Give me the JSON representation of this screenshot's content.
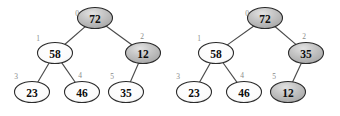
{
  "figure": {
    "background_color": "#ffffff",
    "node_white_fill": "#fbfbfb",
    "node_gray_fill": "#b9b9b9",
    "node_stroke": "#2b2b2b",
    "edge_color": "#4a4a4a",
    "index_label_color": "#8a8a8a",
    "value_label_color": "#0d0d0d"
  },
  "chart_data": {
    "type": "diagram",
    "title": "",
    "subtitle": "",
    "trees": [
      {
        "name": "tree-left",
        "nodes": [
          {
            "index": "0",
            "value": "72",
            "highlight": true,
            "cx": 95,
            "cy": 18,
            "idx_x": 77,
            "idx_y": 13
          },
          {
            "index": "1",
            "value": "58",
            "highlight": false,
            "cx": 55,
            "cy": 53,
            "idx_x": 38,
            "idx_y": 38
          },
          {
            "index": "2",
            "value": "12",
            "highlight": true,
            "cx": 143,
            "cy": 53,
            "idx_x": 142,
            "idx_y": 36
          },
          {
            "index": "3",
            "value": "23",
            "highlight": false,
            "cx": 32,
            "cy": 92,
            "idx_x": 16,
            "idx_y": 76
          },
          {
            "index": "4",
            "value": "46",
            "highlight": false,
            "cx": 82,
            "cy": 92,
            "idx_x": 80,
            "idx_y": 75
          },
          {
            "index": "5",
            "value": "35",
            "highlight": false,
            "cx": 126,
            "cy": 92,
            "idx_x": 112,
            "idx_y": 76
          }
        ],
        "edges": [
          {
            "from": "0",
            "to": "1"
          },
          {
            "from": "0",
            "to": "2"
          },
          {
            "from": "1",
            "to": "3"
          },
          {
            "from": "1",
            "to": "4"
          },
          {
            "from": "2",
            "to": "5"
          }
        ]
      },
      {
        "name": "tree-right",
        "nodes": [
          {
            "index": "0",
            "value": "72",
            "highlight": true,
            "cx": 265,
            "cy": 18,
            "idx_x": 247,
            "idx_y": 13
          },
          {
            "index": "1",
            "value": "58",
            "highlight": false,
            "cx": 216,
            "cy": 53,
            "idx_x": 199,
            "idx_y": 38
          },
          {
            "index": "2",
            "value": "35",
            "highlight": true,
            "cx": 306,
            "cy": 53,
            "idx_x": 304,
            "idx_y": 36
          },
          {
            "index": "3",
            "value": "23",
            "highlight": false,
            "cx": 194,
            "cy": 92,
            "idx_x": 178,
            "idx_y": 76
          },
          {
            "index": "4",
            "value": "46",
            "highlight": false,
            "cx": 244,
            "cy": 92,
            "idx_x": 242,
            "idx_y": 75
          },
          {
            "index": "5",
            "value": "12",
            "highlight": true,
            "cx": 288,
            "cy": 92,
            "idx_x": 274,
            "idx_y": 76
          }
        ],
        "edges": [
          {
            "from": "0",
            "to": "1"
          },
          {
            "from": "0",
            "to": "2"
          },
          {
            "from": "1",
            "to": "3"
          },
          {
            "from": "1",
            "to": "4"
          },
          {
            "from": "2",
            "to": "5"
          }
        ]
      }
    ]
  }
}
